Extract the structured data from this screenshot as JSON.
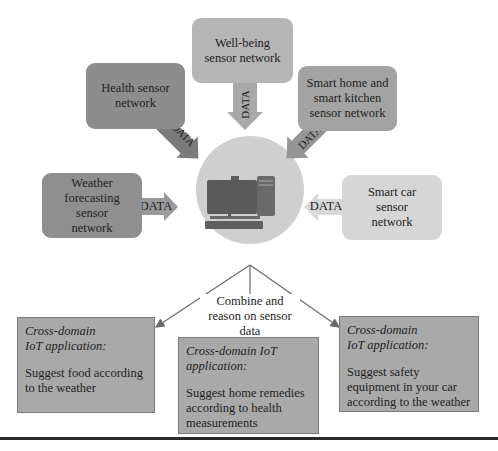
{
  "diagram": {
    "sensor_networks": [
      {
        "id": "well-being",
        "label": "Well-being sensor network",
        "color": "#b5b5b5"
      },
      {
        "id": "health",
        "label": "Health sensor network",
        "color": "#8d8d8d"
      },
      {
        "id": "smart-home",
        "label": "Smart home and smart kitchen sensor network",
        "color": "#a3a3a3"
      },
      {
        "id": "weather",
        "label": "Weather forecasting sensor network",
        "color": "#8f8f8f"
      },
      {
        "id": "smart-car",
        "label": "Smart car sensor network",
        "color": "#d6d6d6"
      }
    ],
    "data_arrow_label": "DATA",
    "hub": {
      "icon": "desktop-computer-icon",
      "circle_color": "#cfcfcf"
    },
    "combine_label": "Combine and reason on sensor data",
    "applications": [
      {
        "title": "Cross-domain IoT application:",
        "text": "Suggest food according to the weather"
      },
      {
        "title": "Cross-domain IoT application:",
        "text": "Suggest home remedies according to health measurements"
      },
      {
        "title": "Cross-domain IoT application:",
        "text": "Suggest safety equipment in your car according to the weather"
      }
    ]
  }
}
